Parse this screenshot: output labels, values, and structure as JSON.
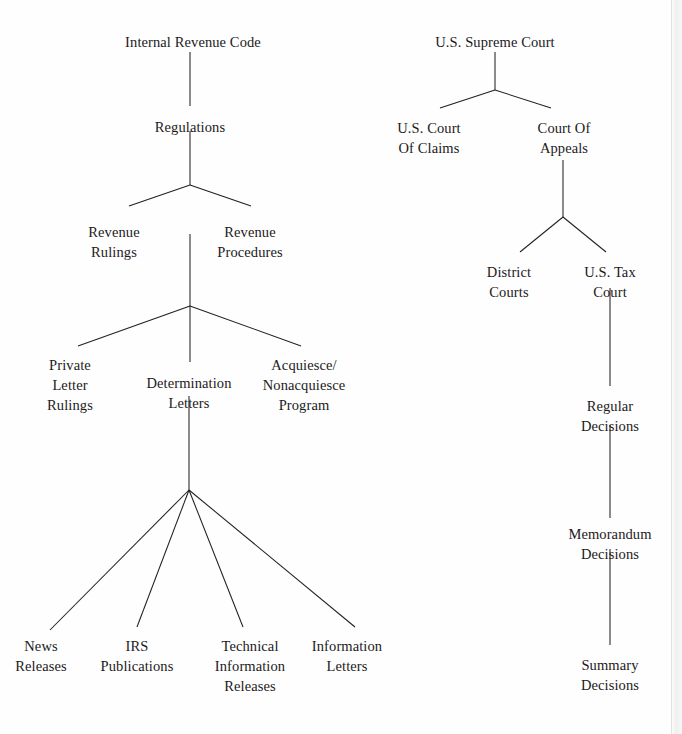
{
  "figure": {
    "kind": "hierarchy-diagram",
    "background_color": "#fefefe",
    "line_color": "#231f20",
    "text_color": "#1c1a1b",
    "width": 682,
    "height": 734
  },
  "trees": [
    {
      "name": "statutory-administrative-authority",
      "root": "Internal Revenue Code",
      "nodes": [
        {
          "id": "internal-revenue-code",
          "label": "Internal Revenue Code",
          "x": 193,
          "y": 32,
          "lines": [
            "Internal Revenue Code"
          ]
        },
        {
          "id": "regulations",
          "label": "Regulations",
          "x": 190,
          "y": 117,
          "lines": [
            "Regulations"
          ]
        },
        {
          "id": "revenue-rulings",
          "label": "Revenue Rulings",
          "x": 114,
          "y": 222,
          "lines": [
            "Revenue",
            "Rulings"
          ]
        },
        {
          "id": "revenue-procedures",
          "label": "Revenue Procedures",
          "x": 250,
          "y": 222,
          "lines": [
            "Revenue",
            "Procedures"
          ]
        },
        {
          "id": "private-letter-rulings",
          "label": "Private Letter Rulings",
          "x": 70,
          "y": 355,
          "lines": [
            "Private",
            "Letter",
            "Rulings"
          ]
        },
        {
          "id": "determination-letters",
          "label": "Determination Letters",
          "x": 189,
          "y": 373,
          "lines": [
            "Determination",
            "Letters"
          ]
        },
        {
          "id": "acquiesce-nonacquiesce-program",
          "label": "Acquiesce/ Nonacquiesce Program",
          "x": 304,
          "y": 355,
          "lines": [
            "Acquiesce/",
            "Nonacquiesce",
            "Program"
          ]
        },
        {
          "id": "news-releases",
          "label": "News Releases",
          "x": 41,
          "y": 636,
          "lines": [
            "News",
            "Releases"
          ]
        },
        {
          "id": "irs-publications",
          "label": "IRS Publications",
          "x": 137,
          "y": 636,
          "lines": [
            "IRS",
            "Publications"
          ]
        },
        {
          "id": "technical-information-releases",
          "label": "Technical Information Releases",
          "x": 250,
          "y": 636,
          "lines": [
            "Technical",
            "Information",
            "Releases"
          ]
        },
        {
          "id": "information-letters",
          "label": "Information Letters",
          "x": 347,
          "y": 636,
          "lines": [
            "Information",
            "Letters"
          ]
        }
      ],
      "edges": [
        {
          "from": "internal-revenue-code",
          "to": "regulations",
          "x1": 190,
          "y1": 52,
          "x2": 190,
          "y2": 106
        },
        {
          "from": "regulations",
          "to": "junction-regulations",
          "x1": 190,
          "y1": 131,
          "x2": 190,
          "y2": 185
        },
        {
          "from": "junction-regulations",
          "to": "revenue-rulings",
          "x1": 190,
          "y1": 185,
          "x2": 129,
          "y2": 206
        },
        {
          "from": "junction-regulations",
          "to": "revenue-procedures",
          "x1": 190,
          "y1": 185,
          "x2": 251,
          "y2": 206
        },
        {
          "from": "revenue-procedures",
          "to": "junction-procedures",
          "x1": 190,
          "y1": 234,
          "x2": 190,
          "y2": 306
        },
        {
          "from": "junction-procedures",
          "to": "private-letter-rulings",
          "x1": 190,
          "y1": 306,
          "x2": 78,
          "y2": 346
        },
        {
          "from": "junction-procedures",
          "to": "determination-letters",
          "x1": 190,
          "y1": 306,
          "x2": 190,
          "y2": 362
        },
        {
          "from": "junction-procedures",
          "to": "acquiesce-nonacquiesce-program",
          "x1": 190,
          "y1": 306,
          "x2": 301,
          "y2": 346
        },
        {
          "from": "determination-letters",
          "to": "junction-letters",
          "x1": 189,
          "y1": 396,
          "x2": 189,
          "y2": 490
        },
        {
          "from": "junction-letters",
          "to": "news-releases",
          "x1": 189,
          "y1": 490,
          "x2": 50,
          "y2": 630
        },
        {
          "from": "junction-letters",
          "to": "irs-publications",
          "x1": 189,
          "y1": 490,
          "x2": 137,
          "y2": 627
        },
        {
          "from": "junction-letters",
          "to": "technical-information-releases",
          "x1": 189,
          "y1": 490,
          "x2": 243,
          "y2": 627
        },
        {
          "from": "junction-letters",
          "to": "information-letters",
          "x1": 189,
          "y1": 490,
          "x2": 355,
          "y2": 627
        }
      ]
    },
    {
      "name": "judicial-authority",
      "root": "U.S. Supreme Court",
      "nodes": [
        {
          "id": "us-supreme-court",
          "label": "U.S. Supreme Court",
          "x": 495,
          "y": 32,
          "lines": [
            "U.S. Supreme Court"
          ]
        },
        {
          "id": "us-court-of-claims",
          "label": "U.S. Court Of Claims",
          "x": 429,
          "y": 118,
          "lines": [
            "U.S. Court",
            "Of Claims"
          ]
        },
        {
          "id": "court-of-appeals",
          "label": "Court Of Appeals",
          "x": 564,
          "y": 118,
          "lines": [
            "Court Of",
            "Appeals"
          ]
        },
        {
          "id": "district-courts",
          "label": "District Courts",
          "x": 509,
          "y": 262,
          "lines": [
            "District",
            "Courts"
          ]
        },
        {
          "id": "us-tax-court",
          "label": "U.S. Tax Court",
          "x": 610,
          "y": 262,
          "lines": [
            "U.S. Tax",
            "Court"
          ]
        },
        {
          "id": "regular-decisions",
          "label": "Regular Decisions",
          "x": 610,
          "y": 396,
          "lines": [
            "Regular",
            "Decisions"
          ]
        },
        {
          "id": "memorandum-decisions",
          "label": "Memorandum Decisions",
          "x": 610,
          "y": 524,
          "lines": [
            "Memorandum",
            "Decisions"
          ]
        },
        {
          "id": "summary-decisions",
          "label": "Summary Decisions",
          "x": 610,
          "y": 655,
          "lines": [
            "Summary",
            "Decisions"
          ]
        }
      ],
      "edges": [
        {
          "from": "us-supreme-court",
          "to": "junction-supreme",
          "x1": 495,
          "y1": 52,
          "x2": 495,
          "y2": 90
        },
        {
          "from": "junction-supreme",
          "to": "us-court-of-claims",
          "x1": 495,
          "y1": 90,
          "x2": 440,
          "y2": 108
        },
        {
          "from": "junction-supreme",
          "to": "court-of-appeals",
          "x1": 495,
          "y1": 90,
          "x2": 551,
          "y2": 108
        },
        {
          "from": "court-of-appeals",
          "to": "junction-appeals",
          "x1": 563,
          "y1": 160,
          "x2": 563,
          "y2": 217
        },
        {
          "from": "junction-appeals",
          "to": "district-courts",
          "x1": 563,
          "y1": 217,
          "x2": 520,
          "y2": 252
        },
        {
          "from": "junction-appeals",
          "to": "us-tax-court",
          "x1": 563,
          "y1": 217,
          "x2": 606,
          "y2": 252
        },
        {
          "from": "us-tax-court",
          "to": "regular-decisions",
          "x1": 610,
          "y1": 288,
          "x2": 610,
          "y2": 386
        },
        {
          "from": "regular-decisions",
          "to": "memorandum-decisions",
          "x1": 610,
          "y1": 425,
          "x2": 610,
          "y2": 518
        },
        {
          "from": "memorandum-decisions",
          "to": "summary-decisions",
          "x1": 610,
          "y1": 549,
          "x2": 610,
          "y2": 645
        }
      ]
    }
  ]
}
